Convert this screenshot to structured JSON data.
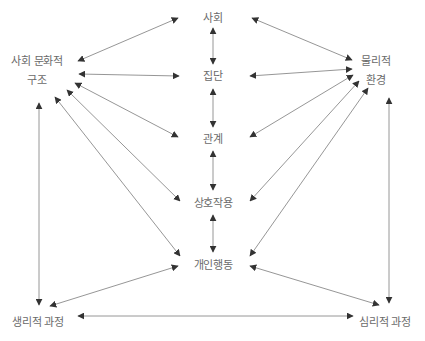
{
  "diagram": {
    "type": "relationship-network",
    "colors": {
      "line": "#8a8a8a",
      "arrowhead": "#333333",
      "text": "#6a6a6a",
      "background": "#ffffff"
    },
    "nodes": {
      "society": {
        "label": "사회"
      },
      "group": {
        "label": "집단"
      },
      "relationship": {
        "label": "관계"
      },
      "interaction": {
        "label": "상호작용"
      },
      "individual_behavior": {
        "label": "개인행동"
      },
      "sociocultural_structure": {
        "line1": "사회 문화적",
        "line2": "구조"
      },
      "physical_environment": {
        "line1": "물리적",
        "line2": "환경"
      },
      "physiological_process": {
        "label": "생리적 과정"
      },
      "psychological_process": {
        "label": "심리적 과정"
      }
    },
    "edges": [
      {
        "from": "society",
        "to": "group",
        "direction": "both"
      },
      {
        "from": "group",
        "to": "relationship",
        "direction": "both"
      },
      {
        "from": "relationship",
        "to": "interaction",
        "direction": "both"
      },
      {
        "from": "interaction",
        "to": "individual_behavior",
        "direction": "both"
      },
      {
        "from": "sociocultural_structure",
        "to": "society",
        "direction": "both"
      },
      {
        "from": "sociocultural_structure",
        "to": "group",
        "direction": "both"
      },
      {
        "from": "sociocultural_structure",
        "to": "relationship",
        "direction": "both"
      },
      {
        "from": "sociocultural_structure",
        "to": "interaction",
        "direction": "both"
      },
      {
        "from": "sociocultural_structure",
        "to": "individual_behavior",
        "direction": "both"
      },
      {
        "from": "sociocultural_structure",
        "to": "physiological_process",
        "direction": "both"
      },
      {
        "from": "physical_environment",
        "to": "society",
        "direction": "both"
      },
      {
        "from": "physical_environment",
        "to": "group",
        "direction": "both"
      },
      {
        "from": "physical_environment",
        "to": "relationship",
        "direction": "both"
      },
      {
        "from": "physical_environment",
        "to": "interaction",
        "direction": "both"
      },
      {
        "from": "physical_environment",
        "to": "individual_behavior",
        "direction": "both"
      },
      {
        "from": "physical_environment",
        "to": "psychological_process",
        "direction": "both"
      },
      {
        "from": "individual_behavior",
        "to": "physiological_process",
        "direction": "both"
      },
      {
        "from": "individual_behavior",
        "to": "psychological_process",
        "direction": "both"
      },
      {
        "from": "physiological_process",
        "to": "psychological_process",
        "direction": "both"
      }
    ]
  }
}
